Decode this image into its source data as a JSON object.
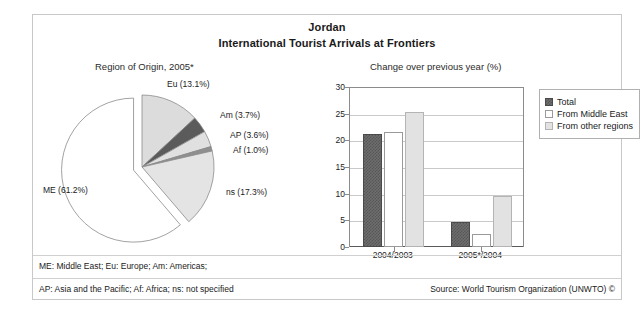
{
  "figure": {
    "title": "Jordan",
    "subtitle": "International Tourist Arrivals at Frontiers",
    "pie_caption": "Region of Origin, 2005*",
    "bar_caption": "Change over previous year (%)"
  },
  "footer": {
    "abbrev_line1": "ME: Middle East; Eu: Europe; Am: Americas;",
    "abbrev_line2": "AP: Asia and the Pacific; Af: Africa; ns: not specified",
    "source": "Source: World Tourism Organization (UNWTO) ©"
  },
  "chart_data": [
    {
      "type": "pie",
      "title": "Region of Origin, 2005*",
      "labels": [
        "ME",
        "ns",
        "Eu",
        "Am",
        "AP",
        "Af"
      ],
      "values": [
        61.2,
        17.3,
        13.1,
        3.7,
        3.6,
        1.0
      ],
      "display_labels": [
        "ME (61.2%)",
        "ns (17.3%)",
        "Eu (13.1%)",
        "Am (3.7%)",
        "AP (3.6%)",
        "Af (1.0%)"
      ],
      "colors": [
        "#ffffff",
        "#e4e4e4",
        "#dcdcdc",
        "#5b5b5b",
        "#e0e0e0",
        "#8f8f8f"
      ],
      "exploded": [
        "ME"
      ],
      "legend": false
    },
    {
      "type": "bar",
      "title": "Change over previous year (%)",
      "categories": [
        "2004/2003",
        "2005*/2004"
      ],
      "series": [
        {
          "name": "Total",
          "values": [
            21.2,
            4.7
          ],
          "color": "#6e6e6e"
        },
        {
          "name": "From Middle East",
          "values": [
            21.5,
            2.5
          ],
          "color": "#ffffff"
        },
        {
          "name": "From other regions",
          "values": [
            25.3,
            9.5
          ],
          "color": "#e2e2e2"
        }
      ],
      "ylim": [
        0,
        30
      ],
      "yticks": [
        0,
        5,
        10,
        15,
        20,
        25,
        30
      ],
      "ylabel": "",
      "xlabel": "",
      "grid": true,
      "legend_position": "right"
    }
  ]
}
